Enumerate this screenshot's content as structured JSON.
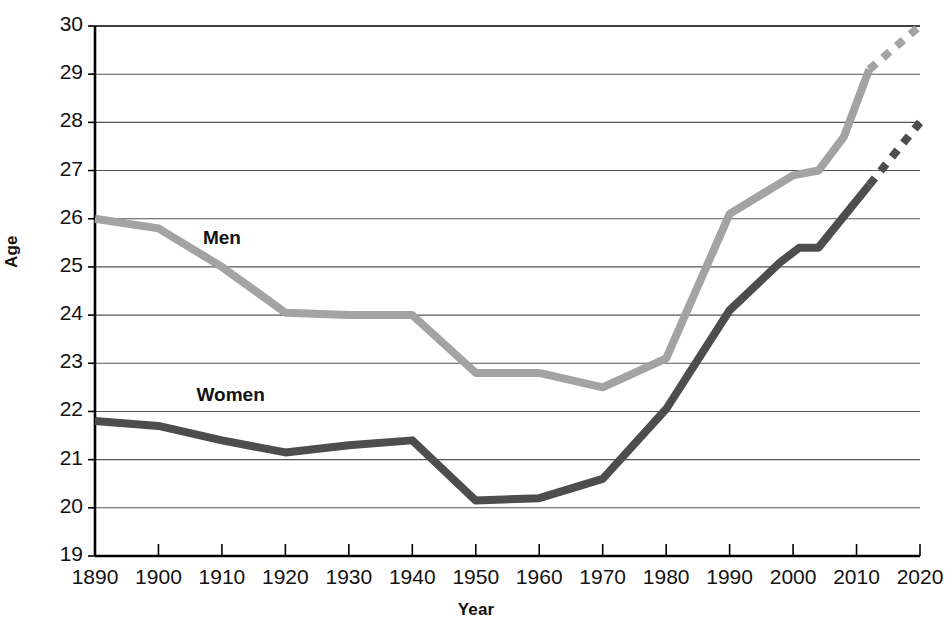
{
  "chart_data": {
    "type": "line",
    "title": "",
    "xlabel": "Year",
    "ylabel": "Age",
    "xlim": [
      1890,
      2020
    ],
    "ylim": [
      19,
      30
    ],
    "grid": true,
    "legend_position": "in-plot-annotation",
    "x_tick_labels": [
      "1890",
      "1900",
      "1910",
      "1920",
      "1930",
      "1940",
      "1950",
      "1960",
      "1970",
      "1980",
      "1990",
      "2000",
      "2010",
      "2020"
    ],
    "y_tick_labels": [
      "19",
      "20",
      "21",
      "22",
      "23",
      "24",
      "25",
      "26",
      "27",
      "28",
      "29",
      "30"
    ],
    "categories": [
      1890,
      1900,
      1910,
      1920,
      1930,
      1940,
      1950,
      1960,
      1970,
      1980,
      1990,
      2000,
      2010,
      2020
    ],
    "series": [
      {
        "name": "Men",
        "color": "#a3a3a3",
        "label_x": 1907,
        "label_y": 25.55,
        "solid_points": [
          [
            1890,
            26.0
          ],
          [
            1900,
            25.8
          ],
          [
            1910,
            25.0
          ],
          [
            1920,
            24.05
          ],
          [
            1930,
            24.0
          ],
          [
            1940,
            24.0
          ],
          [
            1950,
            22.8
          ],
          [
            1960,
            22.8
          ],
          [
            1970,
            22.5
          ],
          [
            1980,
            23.1
          ],
          [
            1990,
            26.1
          ],
          [
            2000,
            26.9
          ],
          [
            2004,
            27.0
          ],
          [
            2008,
            27.7
          ],
          [
            2012,
            29.1
          ]
        ],
        "dashed_points": [
          [
            2012,
            29.1
          ],
          [
            2020,
            30.0
          ]
        ],
        "values": [
          26.0,
          25.8,
          25.0,
          24.05,
          24.0,
          24.0,
          22.8,
          22.8,
          22.5,
          23.1,
          26.1,
          26.9,
          29.1,
          30.0
        ]
      },
      {
        "name": "Women",
        "color": "#4d4d4d",
        "label_x": 1906,
        "label_y": 22.3,
        "solid_points": [
          [
            1890,
            21.8
          ],
          [
            1900,
            21.7
          ],
          [
            1910,
            21.4
          ],
          [
            1920,
            21.15
          ],
          [
            1930,
            21.3
          ],
          [
            1940,
            21.4
          ],
          [
            1950,
            20.15
          ],
          [
            1960,
            20.2
          ],
          [
            1970,
            20.6
          ],
          [
            1980,
            22.05
          ],
          [
            1990,
            24.1
          ],
          [
            1998,
            25.1
          ],
          [
            2001,
            25.4
          ],
          [
            2004,
            25.4
          ],
          [
            2012,
            26.7
          ]
        ],
        "dashed_points": [
          [
            2012,
            26.7
          ],
          [
            2020,
            28.0
          ]
        ],
        "values": [
          21.8,
          21.7,
          21.4,
          21.15,
          21.3,
          21.4,
          20.15,
          20.2,
          20.6,
          22.05,
          24.1,
          25.4,
          26.7,
          28.0
        ]
      }
    ]
  },
  "axes": {
    "y_title": "Age",
    "x_title": "Year"
  },
  "colors": {
    "men_line": "#a3a3a3",
    "women_line": "#4d4d4d",
    "grid": "#555555",
    "frame": "#000000",
    "background": "#ffffff"
  }
}
